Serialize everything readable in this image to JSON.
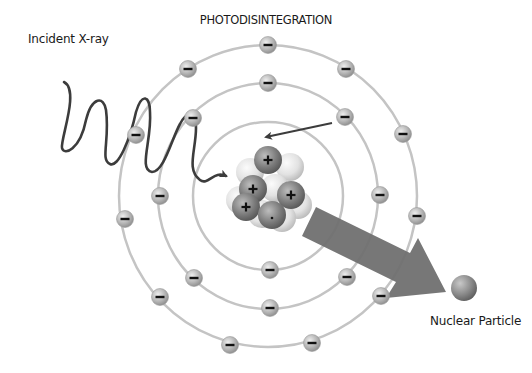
{
  "diagram": {
    "title": "PHOTODISINTEGRATION",
    "labels": {
      "incident": "Incident X-ray",
      "particle": "Nuclear Particle"
    },
    "colors": {
      "orbit": "#c4c4c4",
      "electron_light": "#e6e6e6",
      "electron_dark": "#8a8a8a",
      "wave": "#3c3c3c",
      "big_arrow": "#6e6e6e",
      "proton_light": "#bdbdbd",
      "proton_dark": "#5e5e5e",
      "neutron_light": "#f2f2f2",
      "neutron_dark": "#bcbcbc"
    },
    "atom_center": [
      268,
      196
    ],
    "orbits": [
      {
        "name": "inner",
        "rx": 75,
        "ry": 74
      },
      {
        "name": "middle",
        "rx": 110,
        "ry": 113
      },
      {
        "name": "outer",
        "rx": 149,
        "ry": 151
      }
    ],
    "electrons": [
      [
        268,
        45
      ],
      [
        188,
        69
      ],
      [
        346,
        69
      ],
      [
        136,
        135
      ],
      [
        403,
        134
      ],
      [
        125,
        219
      ],
      [
        417,
        216
      ],
      [
        160,
        297
      ],
      [
        381,
        296
      ],
      [
        230,
        345
      ],
      [
        312,
        343
      ],
      [
        268,
        83
      ],
      [
        193,
        118
      ],
      [
        345,
        117
      ],
      [
        160,
        196
      ],
      [
        380,
        195
      ],
      [
        194,
        278
      ],
      [
        347,
        277
      ],
      [
        270,
        308
      ],
      [
        270,
        270
      ]
    ],
    "electron_symbol": "−",
    "proton_symbol": "+",
    "nucleus": {
      "neutrons": [
        [
          250,
          172
        ],
        [
          290,
          167
        ],
        [
          240,
          200
        ],
        [
          298,
          205
        ],
        [
          262,
          214
        ],
        [
          282,
          218
        ],
        [
          275,
          188
        ]
      ],
      "protons": [
        {
          "x": 268,
          "y": 160,
          "sign": true
        },
        {
          "x": 253,
          "y": 189,
          "sign": true
        },
        {
          "x": 291,
          "y": 195,
          "sign": true
        },
        {
          "x": 246,
          "y": 207,
          "sign": true
        },
        {
          "x": 272,
          "y": 215,
          "sign": false
        }
      ]
    },
    "particle": {
      "x": 464,
      "y": 288,
      "r": 13
    }
  }
}
